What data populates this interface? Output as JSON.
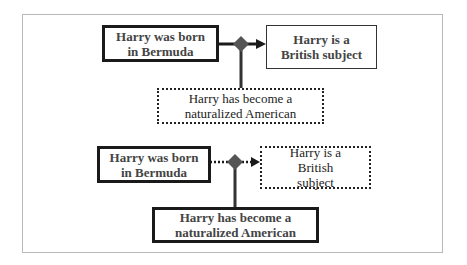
{
  "diagram": {
    "top": {
      "premise": "Harry was born in Bermuda",
      "conclusion": "Harry is a British subject",
      "rebuttal": "Harry has become a naturalized American",
      "premise_style": "thick-solid",
      "conclusion_style": "thin-solid",
      "rebuttal_style": "dotted",
      "link_style": "solid"
    },
    "bottom": {
      "premise": "Harry was born in Bermuda",
      "conclusion": "Harry is a British subject",
      "rebuttal": "Harry has become a naturalized American",
      "premise_style": "thick-solid",
      "conclusion_style": "dotted",
      "rebuttal_style": "thick-solid",
      "link_style": "dotted"
    },
    "colors": {
      "line": "#1a1a1a",
      "diamond": "#555555",
      "frame": "#b8b8b8"
    }
  }
}
